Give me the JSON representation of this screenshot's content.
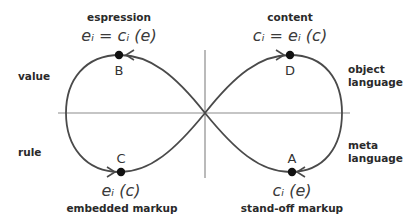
{
  "diagram": {
    "type": "figure-eight-cycle",
    "side_labels": {
      "top_left": "value",
      "bottom_left": "rule",
      "top_right": "object\nlanguage",
      "bottom_right": "meta\nlanguage"
    },
    "points": {
      "B": {
        "label": "B",
        "caption": "espression",
        "formula": "eᵢ = cᵢ (e)"
      },
      "D": {
        "label": "D",
        "caption": "content",
        "formula": "cᵢ = eᵢ (c)"
      },
      "C": {
        "label": "C",
        "caption": "embedded markup",
        "formula": "eᵢ (c)"
      },
      "A": {
        "label": "A",
        "caption": "stand-off markup",
        "formula": "cᵢ (e)"
      }
    },
    "colors": {
      "line": "#4a4a4a",
      "axis": "#8c8c8c",
      "dot": "#111111"
    }
  }
}
